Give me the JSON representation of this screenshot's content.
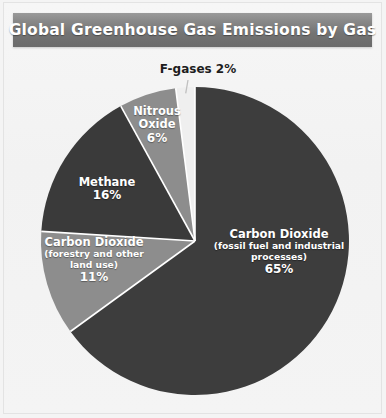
{
  "title": "Global Greenhouse Gas Emissions by Gas",
  "colors": {
    "title_bar_top": "#9a9a9a",
    "title_bar_bottom": "#6b6b6b",
    "title_text": "#ffffff",
    "background": "#f2f2f2",
    "slice_dark": "#3d3d3d",
    "slice_dark_alt": "#3a3a3a",
    "slice_light": "#8d8d8d",
    "slice_lightest": "#efefef",
    "separator": "#ffffff",
    "leader_line": "#b8b8b8"
  },
  "chart_data": {
    "type": "pie",
    "title": "Global Greenhouse Gas Emissions by Gas",
    "xlabel": "",
    "ylabel": "",
    "legend_position": "none",
    "grid": false,
    "units": "percent",
    "total": 100,
    "categories": [
      "Carbon Dioxide (fossil fuel and industrial processes)",
      "Carbon Dioxide (forestry and other land use)",
      "Methane",
      "Nitrous Oxide",
      "F-gases"
    ],
    "values": [
      65,
      11,
      16,
      6,
      2
    ],
    "slices": [
      {
        "key": "co2_fossil",
        "name": "Carbon Dioxide",
        "sub1": "(fossil fuel and industrial",
        "sub2": "processes)",
        "percent_label": "65%",
        "value": 65,
        "color": "#3d3d3d",
        "label_placement": "inside",
        "label_tone": "on-dark"
      },
      {
        "key": "co2_forestry",
        "name": "Carbon Dioxide",
        "sub1": "(forestry and other",
        "sub2": "land use)",
        "percent_label": "11%",
        "value": 11,
        "color": "#8d8d8d",
        "label_placement": "inside",
        "label_tone": "on-light"
      },
      {
        "key": "methane",
        "name": "Methane",
        "sub1": "",
        "sub2": "",
        "percent_label": "16%",
        "value": 16,
        "color": "#3a3a3a",
        "label_placement": "inside",
        "label_tone": "on-dark"
      },
      {
        "key": "nitrous_oxide",
        "name": "Nitrous",
        "sub1": "Oxide",
        "sub2": "",
        "percent_label": "6%",
        "value": 6,
        "color": "#8d8d8d",
        "label_placement": "inside",
        "label_tone": "on-light"
      },
      {
        "key": "fgases",
        "name": "F-gases 2%",
        "sub1": "",
        "sub2": "",
        "percent_label": "2%",
        "value": 2,
        "color": "#efefef",
        "label_placement": "outside-callout",
        "label_tone": "on-bg"
      }
    ],
    "geometry": {
      "center_x": 195,
      "center_y": 241,
      "radius": 154,
      "start_angle_deg": 0,
      "direction": "clockwise"
    }
  }
}
